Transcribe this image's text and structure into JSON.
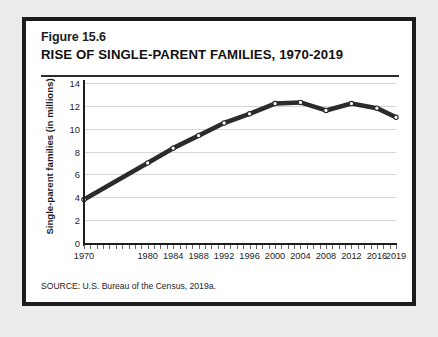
{
  "figure": {
    "number_label": "Figure 15.6",
    "title": "RISE OF SINGLE-PARENT FAMILIES, 1970-2019",
    "source": "SOURCE: U.S. Bureau of the Census, 2019a.",
    "border_color": "#1d1d1f",
    "page_background": "#ececed",
    "panel_background": "#ffffff"
  },
  "chart_data": {
    "type": "line",
    "title": "RISE OF SINGLE-PARENT FAMILIES, 1970-2019",
    "xlabel": "",
    "ylabel": "Single-parent families (in millions)",
    "xlim": [
      1970,
      2019
    ],
    "ylim": [
      0,
      14
    ],
    "yticks": [
      0,
      2,
      4,
      6,
      8,
      10,
      12,
      14
    ],
    "xticks": [
      1970,
      1980,
      1984,
      1988,
      1992,
      1996,
      2000,
      2004,
      2008,
      2012,
      2016,
      2019
    ],
    "grid": "horizontal",
    "legend": "none",
    "line_color": "#2b2b2d",
    "marker_style": "white-filled circle with dark outline",
    "x": [
      1970,
      1980,
      1984,
      1988,
      1992,
      1996,
      2000,
      2004,
      2008,
      2012,
      2016,
      2019
    ],
    "values": [
      3.8,
      7.0,
      8.3,
      9.4,
      10.5,
      11.3,
      12.2,
      12.3,
      11.6,
      12.2,
      11.8,
      11.0
    ],
    "series": [
      {
        "name": "Single-parent families",
        "values": [
          3.8,
          7.0,
          8.3,
          9.4,
          10.5,
          11.3,
          12.2,
          12.3,
          11.6,
          12.2,
          11.8,
          11.0
        ]
      }
    ]
  }
}
